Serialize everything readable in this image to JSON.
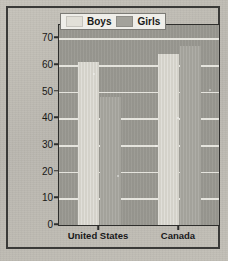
{
  "chart_data": {
    "type": "bar",
    "title": "",
    "xlabel": "",
    "ylabel": "Percentage of High School Students",
    "categories": [
      "United States",
      "Canada"
    ],
    "series": [
      {
        "name": "Boys",
        "color": "#d8d6ce",
        "values": [
          61,
          64
        ]
      },
      {
        "name": "Girls",
        "color": "#a8a7a0",
        "values": [
          48,
          67
        ]
      }
    ],
    "ylim": [
      0,
      75
    ],
    "yticks": [
      0,
      10,
      20,
      30,
      40,
      50,
      60,
      70
    ],
    "ytick_labels": [
      "0",
      "10",
      "20",
      "30",
      "40",
      "50",
      "60",
      "70"
    ],
    "grid": "horizontal",
    "legend_position": "top-right",
    "legend": [
      "Boys",
      "Girls"
    ]
  },
  "legend": {
    "items": [
      {
        "label": "Boys",
        "swatch": "boys-swatch"
      },
      {
        "label": "Girls",
        "swatch": "girls-swatch"
      }
    ]
  }
}
